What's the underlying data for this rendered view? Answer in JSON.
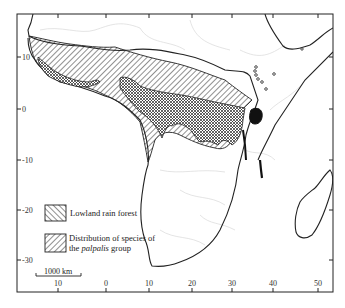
{
  "map": {
    "title": "Distribution of palpalis group in Africa",
    "frame": {
      "left": 17,
      "top": 14,
      "right": 333,
      "bottom": 292
    },
    "lat_ticks": [
      {
        "label": "10",
        "y": 57
      },
      {
        "label": "0",
        "y": 109
      },
      {
        "label": "-10",
        "y": 160
      },
      {
        "label": "-20",
        "y": 210
      },
      {
        "label": "-30",
        "y": 260
      }
    ],
    "lon_ticks": [
      {
        "label": "10",
        "x": 58
      },
      {
        "label": "0",
        "x": 106
      },
      {
        "label": "10",
        "x": 149
      },
      {
        "label": "20",
        "x": 192
      },
      {
        "label": "30",
        "x": 232
      },
      {
        "label": "40",
        "x": 273
      },
      {
        "label": "50",
        "x": 318
      }
    ],
    "legend": {
      "items": [
        {
          "label": "Lowland rain forest",
          "pattern": "forward-hatch"
        },
        {
          "label_line1": "Distribution of species of",
          "label_line2_pre": "the ",
          "label_line2_italic": "palpalis",
          "label_line2_post": " group",
          "pattern": "back-hatch"
        }
      ]
    },
    "scale_bar": {
      "label": "1000 km"
    },
    "colors": {
      "ink": "#222222",
      "border_faint": "#d8d8d8",
      "background": "#ffffff"
    }
  }
}
